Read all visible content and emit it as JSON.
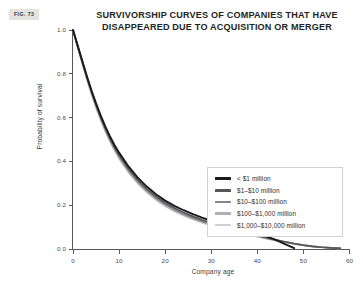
{
  "figure": {
    "tag": "FIG. 73"
  },
  "header": {
    "title_line1": "SURVIVORSHIP CURVES OF COMPANIES THAT HAVE",
    "title_line2": "DISAPPEARED DUE TO ACQUISITION OR MERGER"
  },
  "chart_data": {
    "type": "line",
    "title": "SURVIVORSHIP CURVES OF COMPANIES THAT HAVE DISAPPEARED DUE TO ACQUISITION OR MERGER",
    "xlabel": "Company age",
    "ylabel": "Probability of survival",
    "xlim": [
      0,
      60
    ],
    "ylim": [
      0.0,
      1.0
    ],
    "grid": false,
    "legend_position": "center-right",
    "xticks": [
      0,
      10,
      20,
      30,
      40,
      50,
      60
    ],
    "xtick_labels": [
      "0",
      "10",
      "20",
      "30",
      "40",
      "50",
      "60"
    ],
    "yticks": [
      0.0,
      0.2,
      0.4,
      0.6,
      0.8,
      1.0
    ],
    "ytick_labels": [
      "0.0",
      "0.2",
      "0.4",
      "0.6",
      "0.8",
      "1.0"
    ],
    "colors": [
      "#1a1a1a",
      "#56565a",
      "#85858a",
      "#b0b0b4",
      "#d2d2d6"
    ],
    "x": [
      0,
      1,
      2,
      3,
      4,
      5,
      6,
      7,
      8,
      9,
      10,
      12,
      14,
      16,
      18,
      20,
      22,
      24,
      26,
      28,
      30,
      32,
      34,
      36,
      38,
      40,
      42,
      44,
      46,
      48,
      50,
      52,
      54,
      56,
      58
    ],
    "series": [
      {
        "name": "< $1 million",
        "color": "#1a1a1a",
        "values": [
          1.0,
          0.93,
          0.86,
          0.79,
          0.725,
          0.665,
          0.61,
          0.56,
          0.515,
          0.475,
          0.44,
          0.378,
          0.327,
          0.285,
          0.25,
          0.221,
          0.197,
          0.177,
          0.159,
          0.143,
          0.129,
          0.118,
          0.108,
          0.096,
          0.084,
          0.072,
          0.058,
          0.042,
          0.022,
          0.004,
          null,
          null,
          null,
          null,
          null
        ]
      },
      {
        "name": "$1–$10 million",
        "color": "#56565a",
        "values": [
          1.0,
          0.928,
          0.857,
          0.787,
          0.721,
          0.66,
          0.604,
          0.553,
          0.507,
          0.466,
          0.43,
          0.368,
          0.317,
          0.275,
          0.24,
          0.211,
          0.187,
          0.167,
          0.149,
          0.133,
          0.119,
          0.107,
          0.096,
          0.085,
          0.074,
          0.063,
          0.052,
          0.042,
          0.033,
          0.025,
          0.018,
          0.012,
          0.008,
          0.005,
          0.003
        ]
      },
      {
        "name": "$10–$100 million",
        "color": "#85858a",
        "values": [
          1.0,
          0.926,
          0.853,
          0.782,
          0.716,
          0.654,
          0.598,
          0.547,
          0.501,
          0.46,
          0.423,
          0.361,
          0.31,
          0.268,
          0.233,
          0.204,
          0.18,
          0.16,
          0.142,
          0.127,
          0.113,
          0.101,
          0.09,
          0.08,
          0.07,
          0.06,
          0.05,
          0.041,
          0.032,
          0.024,
          0.017,
          0.012,
          0.008,
          0.005,
          0.003
        ]
      },
      {
        "name": "$100–$1,000 million",
        "color": "#b0b0b4",
        "values": [
          1.0,
          0.924,
          0.85,
          0.778,
          0.711,
          0.649,
          0.593,
          0.541,
          0.495,
          0.454,
          0.417,
          0.355,
          0.304,
          0.262,
          0.228,
          0.199,
          0.175,
          0.155,
          0.138,
          0.123,
          0.109,
          0.098,
          0.087,
          0.077,
          0.067,
          0.058,
          0.048,
          0.039,
          0.031,
          0.023,
          0.017,
          0.012,
          0.008,
          0.005,
          0.003
        ]
      },
      {
        "name": "$1,000–$10,000 million",
        "color": "#d2d2d6",
        "values": [
          1.0,
          0.922,
          0.847,
          0.775,
          0.707,
          0.645,
          0.588,
          0.537,
          0.491,
          0.449,
          0.412,
          0.35,
          0.299,
          0.258,
          0.224,
          0.195,
          0.171,
          0.152,
          0.135,
          0.12,
          0.107,
          0.095,
          0.085,
          0.075,
          0.065,
          0.056,
          0.047,
          0.038,
          0.03,
          0.023,
          0.016,
          0.011,
          0.008,
          0.005,
          0.003
        ]
      }
    ]
  },
  "legend": {
    "items": [
      {
        "label": "< $1 million",
        "color": "#1a1a1a"
      },
      {
        "label": "$1–$10 million",
        "color": "#56565a"
      },
      {
        "label": "$10–$100 million",
        "color": "#85858a"
      },
      {
        "label": "$100–$1,000 million",
        "color": "#b0b0b4"
      },
      {
        "label": "$1,000–$10,000 million",
        "color": "#d2d2d6"
      }
    ]
  }
}
